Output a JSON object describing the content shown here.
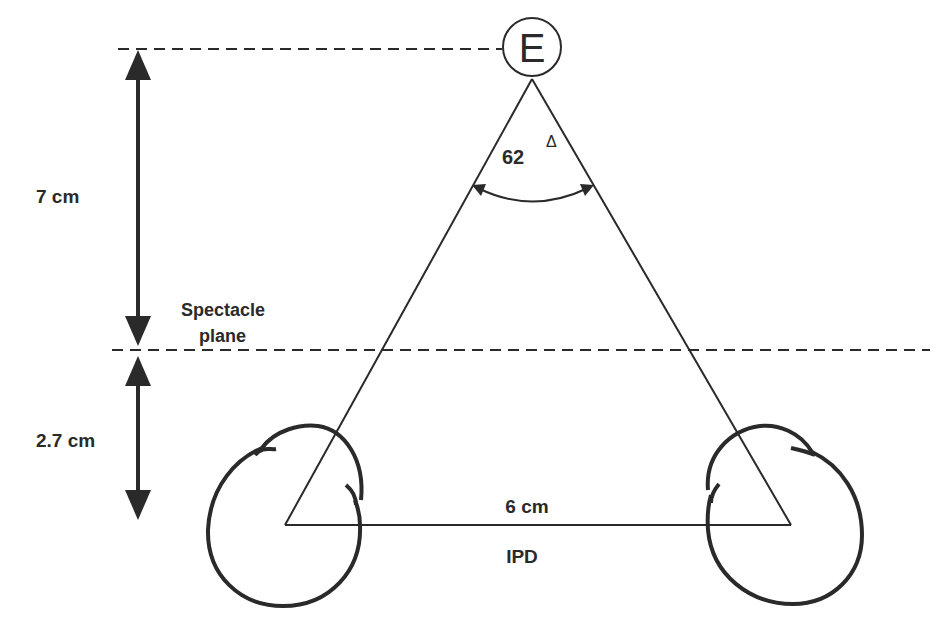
{
  "diagram": {
    "type": "geometric-optics-diagram",
    "stroke_color": "#2a2a2a",
    "labels": {
      "target": "E",
      "angle": "62",
      "angle_unit": "Δ",
      "top_distance": "7 cm",
      "spectacle_line1": "Spectacle",
      "spectacle_line2": "plane",
      "bottom_distance": "2.7 cm",
      "base_distance": "6 cm",
      "base_name": "IPD"
    },
    "elements": {
      "target_circle": {
        "cx": 532,
        "cy": 47,
        "r": 29
      },
      "apex": {
        "x": 532,
        "y": 79
      },
      "left_eye_center": {
        "x": 285,
        "y": 525
      },
      "right_eye_center": {
        "x": 791,
        "y": 525
      },
      "top_dashed_y": 49,
      "spectacle_dashed_y": 350,
      "arrow_x": 138
    }
  }
}
